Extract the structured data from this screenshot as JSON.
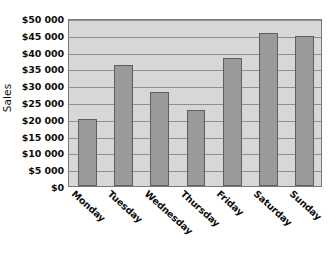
{
  "chart_data": {
    "type": "bar",
    "title": "",
    "xlabel": "",
    "ylabel": "Sales",
    "categories": [
      "Monday",
      "Tuesday",
      "Wednesday",
      "Thursday",
      "Friday",
      "Saturday",
      "Sunday"
    ],
    "values": [
      20000,
      36000,
      28000,
      22500,
      38000,
      45500,
      44500
    ],
    "ylim": [
      0,
      50000
    ],
    "ytick_values": [
      0,
      5000,
      10000,
      15000,
      20000,
      25000,
      30000,
      35000,
      40000,
      45000,
      50000
    ],
    "ytick_labels": [
      "$0",
      "$5 000",
      "$10 000",
      "$15 000",
      "$20 000",
      "$25 000",
      "$30 000",
      "$35 000",
      "$40 000",
      "$45 000",
      "$50 000"
    ],
    "grid": true,
    "grid_axis": "y",
    "legend": false,
    "legend_position": "none",
    "xtick_rotation": 42,
    "series": [
      {
        "name": "Sales",
        "values": [
          20000,
          36000,
          28000,
          22500,
          38000,
          45500,
          44500
        ]
      }
    ],
    "colors": {
      "bar_fill": "#9a9a9a",
      "bar_border": "#5f5f5f",
      "plot_background": "#d7d7d7",
      "gridline": "#8f8f8f",
      "axis": "#7a7a7a",
      "text": "#0d0d0d",
      "figure_background": "#ffffff"
    }
  }
}
